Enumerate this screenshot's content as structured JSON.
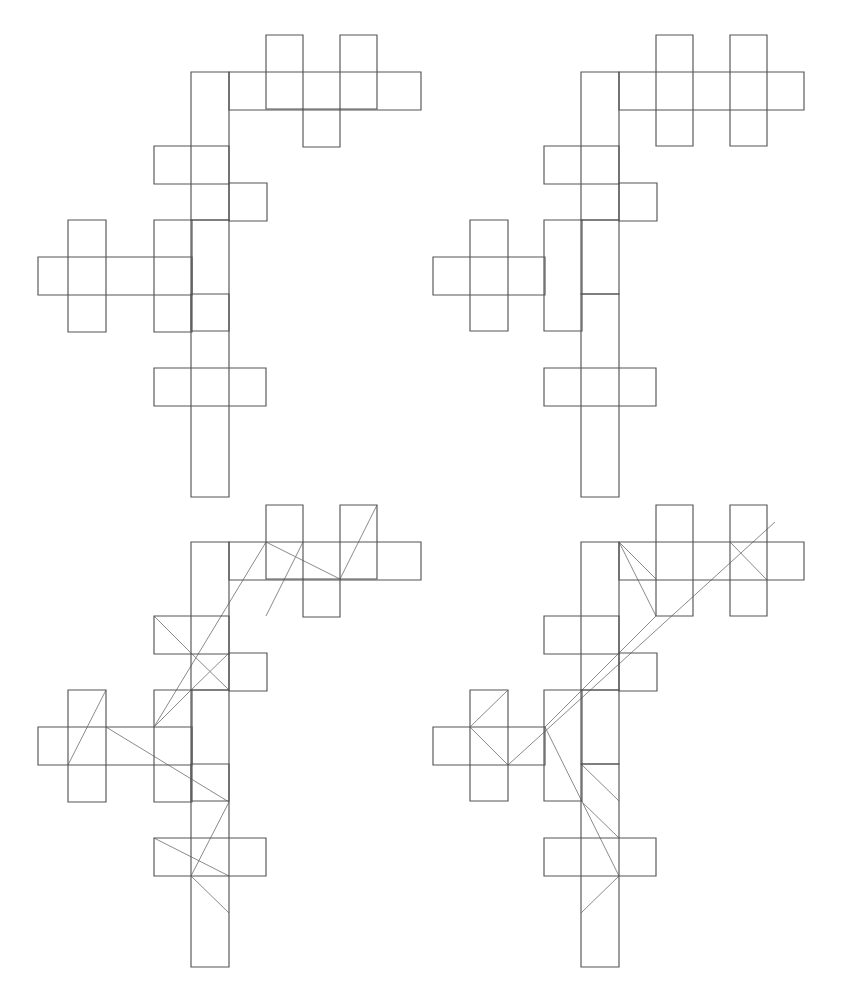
{
  "figure": {
    "canvas": {
      "width": 845,
      "height": 995,
      "background": "#ffffff"
    },
    "style": {
      "rect_stroke": "#555555",
      "rect_stroke_width": 1.15,
      "edge_stroke": "#8a8a8a",
      "edge_stroke_width": 1.0,
      "fill": "none"
    },
    "grid": {
      "unit_px": 37,
      "note": "all rectangles are axis-aligned multiples of the unit cell"
    }
  },
  "panels": [
    {
      "id": "top-left",
      "name": "packing-a-plain",
      "label": "Packing A (outline only)",
      "origin": {
        "x": 0,
        "y": 0
      },
      "has_graph_overlay": false,
      "rects": [
        {
          "id": "a1",
          "x": 266,
          "y": 35,
          "w": 37,
          "h": 74
        },
        {
          "id": "a2",
          "x": 340,
          "y": 35,
          "w": 37,
          "h": 74
        },
        {
          "id": "a3",
          "x": 229,
          "y": 72,
          "w": 192,
          "h": 38
        },
        {
          "id": "a4",
          "x": 303,
          "y": 109,
          "w": 37,
          "h": 38
        },
        {
          "id": "a5",
          "x": 191,
          "y": 72,
          "w": 38,
          "h": 148
        },
        {
          "id": "a6",
          "x": 154,
          "y": 146,
          "w": 75,
          "h": 38
        },
        {
          "id": "a7",
          "x": 229,
          "y": 183,
          "w": 38,
          "h": 38
        },
        {
          "id": "a8",
          "x": 154,
          "y": 220,
          "w": 38,
          "h": 112
        },
        {
          "id": "a9",
          "x": 68,
          "y": 220,
          "w": 38,
          "h": 112
        },
        {
          "id": "a10",
          "x": 38,
          "y": 257,
          "w": 154,
          "h": 38
        },
        {
          "id": "a11",
          "x": 191,
          "y": 220,
          "w": 38,
          "h": 111
        },
        {
          "id": "a12",
          "x": 191,
          "y": 294,
          "w": 38,
          "h": 203
        },
        {
          "id": "a13",
          "x": 154,
          "y": 368,
          "w": 112,
          "h": 38
        }
      ]
    },
    {
      "id": "top-right",
      "name": "packing-b-plain",
      "label": "Packing B (outline only)",
      "origin": {
        "x": 430,
        "y": 0
      },
      "has_graph_overlay": false,
      "rects": [
        {
          "id": "b1",
          "x": 656,
          "y": 35,
          "w": 37,
          "h": 111
        },
        {
          "id": "b2",
          "x": 730,
          "y": 35,
          "w": 37,
          "h": 111
        },
        {
          "id": "b3",
          "x": 619,
          "y": 72,
          "w": 185,
          "h": 38
        },
        {
          "id": "b4",
          "x": 581,
          "y": 72,
          "w": 38,
          "h": 148
        },
        {
          "id": "b5",
          "x": 544,
          "y": 146,
          "w": 75,
          "h": 38
        },
        {
          "id": "b6",
          "x": 619,
          "y": 183,
          "w": 38,
          "h": 38
        },
        {
          "id": "b7",
          "x": 544,
          "y": 220,
          "w": 38,
          "h": 111
        },
        {
          "id": "b8",
          "x": 470,
          "y": 220,
          "w": 38,
          "h": 111
        },
        {
          "id": "b9",
          "x": 433,
          "y": 257,
          "w": 112,
          "h": 38
        },
        {
          "id": "b10",
          "x": 581,
          "y": 220,
          "w": 38,
          "h": 74
        },
        {
          "id": "b11",
          "x": 581,
          "y": 294,
          "w": 38,
          "h": 203
        },
        {
          "id": "b12",
          "x": 544,
          "y": 368,
          "w": 112,
          "h": 38
        }
      ]
    },
    {
      "id": "bottom-left",
      "name": "packing-a-with-graph",
      "label": "Packing A (with contact graph)",
      "origin": {
        "x": 0,
        "y": 495
      },
      "has_graph_overlay": true,
      "rects": [
        {
          "id": "c1",
          "x": 266,
          "y": 505,
          "w": 37,
          "h": 74
        },
        {
          "id": "c2",
          "x": 340,
          "y": 505,
          "w": 37,
          "h": 74
        },
        {
          "id": "c3",
          "x": 229,
          "y": 542,
          "w": 192,
          "h": 38
        },
        {
          "id": "c4",
          "x": 303,
          "y": 579,
          "w": 37,
          "h": 38
        },
        {
          "id": "c5",
          "x": 191,
          "y": 542,
          "w": 38,
          "h": 148
        },
        {
          "id": "c6",
          "x": 154,
          "y": 616,
          "w": 75,
          "h": 38
        },
        {
          "id": "c7",
          "x": 229,
          "y": 653,
          "w": 38,
          "h": 38
        },
        {
          "id": "c8",
          "x": 154,
          "y": 690,
          "w": 38,
          "h": 112
        },
        {
          "id": "c9",
          "x": 68,
          "y": 690,
          "w": 38,
          "h": 112
        },
        {
          "id": "c10",
          "x": 38,
          "y": 727,
          "w": 154,
          "h": 38
        },
        {
          "id": "c11",
          "x": 191,
          "y": 690,
          "w": 38,
          "h": 111
        },
        {
          "id": "c12",
          "x": 191,
          "y": 764,
          "w": 38,
          "h": 203
        },
        {
          "id": "c13",
          "x": 154,
          "y": 838,
          "w": 112,
          "h": 38
        }
      ],
      "edges": [
        {
          "from": [
            266,
            616
          ],
          "to": [
            303,
            542
          ]
        },
        {
          "from": [
            266,
            542
          ],
          "to": [
            340,
            579
          ]
        },
        {
          "from": [
            340,
            579
          ],
          "to": [
            377,
            505
          ]
        },
        {
          "from": [
            266,
            542
          ],
          "to": [
            154,
            727
          ]
        },
        {
          "from": [
            154,
            727
          ],
          "to": [
            191,
            690
          ]
        },
        {
          "from": [
            191,
            690
          ],
          "to": [
            229,
            653
          ]
        },
        {
          "from": [
            154,
            616
          ],
          "to": [
            191,
            653
          ]
        },
        {
          "from": [
            191,
            653
          ],
          "to": [
            229,
            690
          ]
        },
        {
          "from": [
            68,
            765
          ],
          "to": [
            106,
            690
          ]
        },
        {
          "from": [
            106,
            727
          ],
          "to": [
            229,
            802
          ]
        },
        {
          "from": [
            229,
            802
          ],
          "to": [
            191,
            876
          ]
        },
        {
          "from": [
            191,
            876
          ],
          "to": [
            229,
            913
          ]
        },
        {
          "from": [
            154,
            838
          ],
          "to": [
            229,
            876
          ]
        }
      ]
    },
    {
      "id": "bottom-right",
      "name": "packing-b-with-graph",
      "label": "Packing B (with contact graph)",
      "origin": {
        "x": 430,
        "y": 495
      },
      "has_graph_overlay": true,
      "rects": [
        {
          "id": "d1",
          "x": 656,
          "y": 505,
          "w": 37,
          "h": 111
        },
        {
          "id": "d2",
          "x": 730,
          "y": 505,
          "w": 37,
          "h": 111
        },
        {
          "id": "d3",
          "x": 619,
          "y": 542,
          "w": 185,
          "h": 38
        },
        {
          "id": "d4",
          "x": 581,
          "y": 542,
          "w": 38,
          "h": 148
        },
        {
          "id": "d5",
          "x": 544,
          "y": 616,
          "w": 75,
          "h": 38
        },
        {
          "id": "d6",
          "x": 619,
          "y": 653,
          "w": 38,
          "h": 38
        },
        {
          "id": "d7",
          "x": 544,
          "y": 690,
          "w": 38,
          "h": 111
        },
        {
          "id": "d8",
          "x": 470,
          "y": 690,
          "w": 38,
          "h": 111
        },
        {
          "id": "d9",
          "x": 433,
          "y": 727,
          "w": 112,
          "h": 38
        },
        {
          "id": "d10",
          "x": 581,
          "y": 690,
          "w": 38,
          "h": 74
        },
        {
          "id": "d11",
          "x": 581,
          "y": 764,
          "w": 38,
          "h": 203
        },
        {
          "id": "d12",
          "x": 544,
          "y": 838,
          "w": 112,
          "h": 38
        }
      ],
      "edges": [
        {
          "from": [
            508,
            765
          ],
          "to": [
            775,
            522
          ]
        },
        {
          "from": [
            508,
            765
          ],
          "to": [
            470,
            727
          ]
        },
        {
          "from": [
            470,
            727
          ],
          "to": [
            508,
            690
          ]
        },
        {
          "from": [
            545,
            727
          ],
          "to": [
            619,
            653
          ]
        },
        {
          "from": [
            619,
            653
          ],
          "to": [
            656,
            616
          ]
        },
        {
          "from": [
            656,
            616
          ],
          "to": [
            619,
            542
          ]
        },
        {
          "from": [
            619,
            542
          ],
          "to": [
            656,
            579
          ]
        },
        {
          "from": [
            730,
            542
          ],
          "to": [
            767,
            580
          ]
        },
        {
          "from": [
            545,
            727
          ],
          "to": [
            619,
            876
          ]
        },
        {
          "from": [
            619,
            876
          ],
          "to": [
            581,
            913
          ]
        },
        {
          "from": [
            581,
            801
          ],
          "to": [
            619,
            838
          ]
        },
        {
          "from": [
            619,
            801
          ],
          "to": [
            581,
            764
          ]
        }
      ]
    }
  ]
}
